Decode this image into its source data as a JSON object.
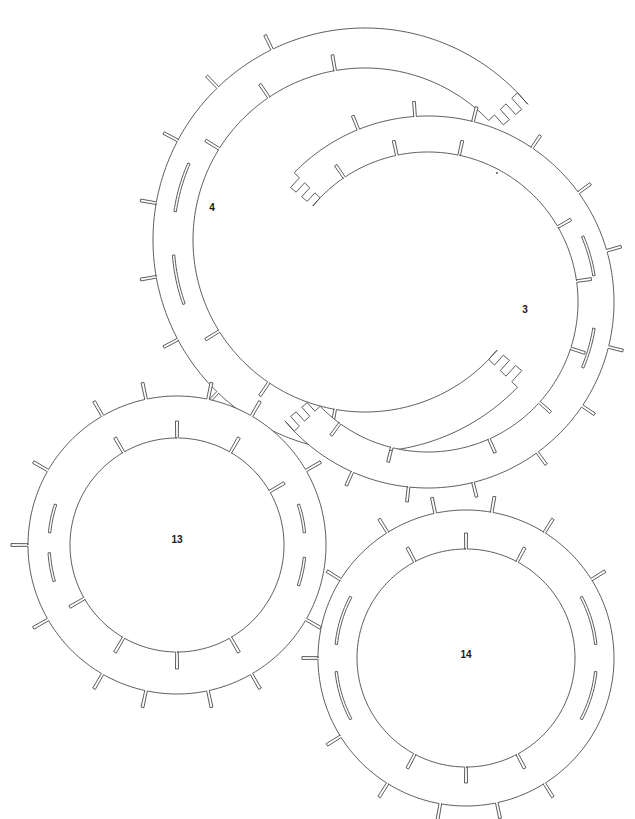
{
  "drawing": {
    "title": "Laser-Cut Ring Parts Layout",
    "background_color": "#ffffff",
    "line_color": "#4a4a4a",
    "line_width": 0.9,
    "label_color": "#1a1a1a",
    "label_font_size": 10,
    "canvas": {
      "width": 635,
      "height": 819
    }
  },
  "parts": [
    {
      "id": "part-4",
      "label": "4",
      "label_x": 212,
      "label_y": 208,
      "shape": "split-ring-c",
      "center_x": 365,
      "center_y": 240,
      "outer_radius": 212,
      "inner_radius": 172,
      "gap_start_deg": -44,
      "gap_end_deg": 44,
      "step_depth": 14,
      "step_count": 5,
      "outer_notches": [
        118,
        134,
        152,
        170,
        190,
        208,
        226,
        244
      ],
      "inner_notches": [
        100,
        124,
        148,
        212,
        236,
        260
      ],
      "notch_depth": 16,
      "notch_width": 2.6,
      "long_slots": [
        {
          "angle_deg": 168,
          "span_deg": 15,
          "radius_frac": 0.5
        },
        {
          "angle_deg": 196,
          "span_deg": 15,
          "radius_frac": 0.5
        }
      ]
    },
    {
      "id": "part-3",
      "label": "3",
      "label_x": 525,
      "label_y": 310,
      "shape": "split-ring-c",
      "center_x": 428,
      "center_y": 302,
      "outer_radius": 186,
      "inner_radius": 150,
      "gap_start_deg": 136,
      "gap_end_deg": 224,
      "step_depth": 13,
      "step_count": 5,
      "outer_notches": [
        248,
        266,
        284,
        304,
        324,
        344,
        14,
        34,
        54,
        76,
        96,
        114
      ],
      "inner_notches": [
        236,
        258,
        282,
        330,
        352,
        18,
        42,
        66,
        104,
        126
      ],
      "notch_depth": 15,
      "notch_width": 2.6,
      "long_slots": [
        {
          "angle_deg": 344,
          "span_deg": 14,
          "radius_frac": 0.5
        },
        {
          "angle_deg": 16,
          "span_deg": 14,
          "radius_frac": 0.5
        }
      ]
    },
    {
      "id": "part-13",
      "label": "13",
      "label_x": 177,
      "label_y": 540,
      "shape": "full-ring",
      "center_x": 177,
      "center_y": 545,
      "outer_radius": 149,
      "inner_radius": 107,
      "outer_notches": [
        60,
        78,
        102,
        120,
        150,
        180,
        210,
        240,
        258,
        282,
        300,
        330,
        0,
        30
      ],
      "inner_notches": [
        60,
        90,
        120,
        150,
        240,
        270,
        300,
        330,
        0
      ],
      "notch_depth": 17,
      "notch_width": 2.6,
      "long_slots": [
        {
          "angle_deg": 170,
          "span_deg": 13,
          "radius_frac": 0.5
        },
        {
          "angle_deg": 192,
          "span_deg": 13,
          "radius_frac": 0.5
        },
        {
          "angle_deg": 348,
          "span_deg": 13,
          "radius_frac": 0.5
        },
        {
          "angle_deg": 12,
          "span_deg": 13,
          "radius_frac": 0.5
        }
      ]
    },
    {
      "id": "part-14",
      "label": "14",
      "label_x": 466,
      "label_y": 655,
      "shape": "full-ring",
      "center_x": 466,
      "center_y": 658,
      "outer_radius": 148,
      "inner_radius": 109,
      "outer_notches": [
        58,
        78,
        100,
        122,
        148,
        180,
        212,
        238,
        258,
        280,
        302,
        328,
        0
      ],
      "inner_notches": [
        62,
        90,
        118,
        242,
        270,
        298
      ],
      "notch_depth": 16,
      "notch_width": 2.6,
      "long_slots": [
        {
          "angle_deg": 163,
          "span_deg": 22,
          "radius_frac": 0.55
        },
        {
          "angle_deg": 197,
          "span_deg": 22,
          "radius_frac": 0.55
        },
        {
          "angle_deg": 343,
          "span_deg": 22,
          "radius_frac": 0.55
        },
        {
          "angle_deg": 17,
          "span_deg": 22,
          "radius_frac": 0.55
        }
      ]
    }
  ],
  "stray_marks": [
    {
      "x": 497,
      "y": 173,
      "radius": 0.9
    }
  ]
}
